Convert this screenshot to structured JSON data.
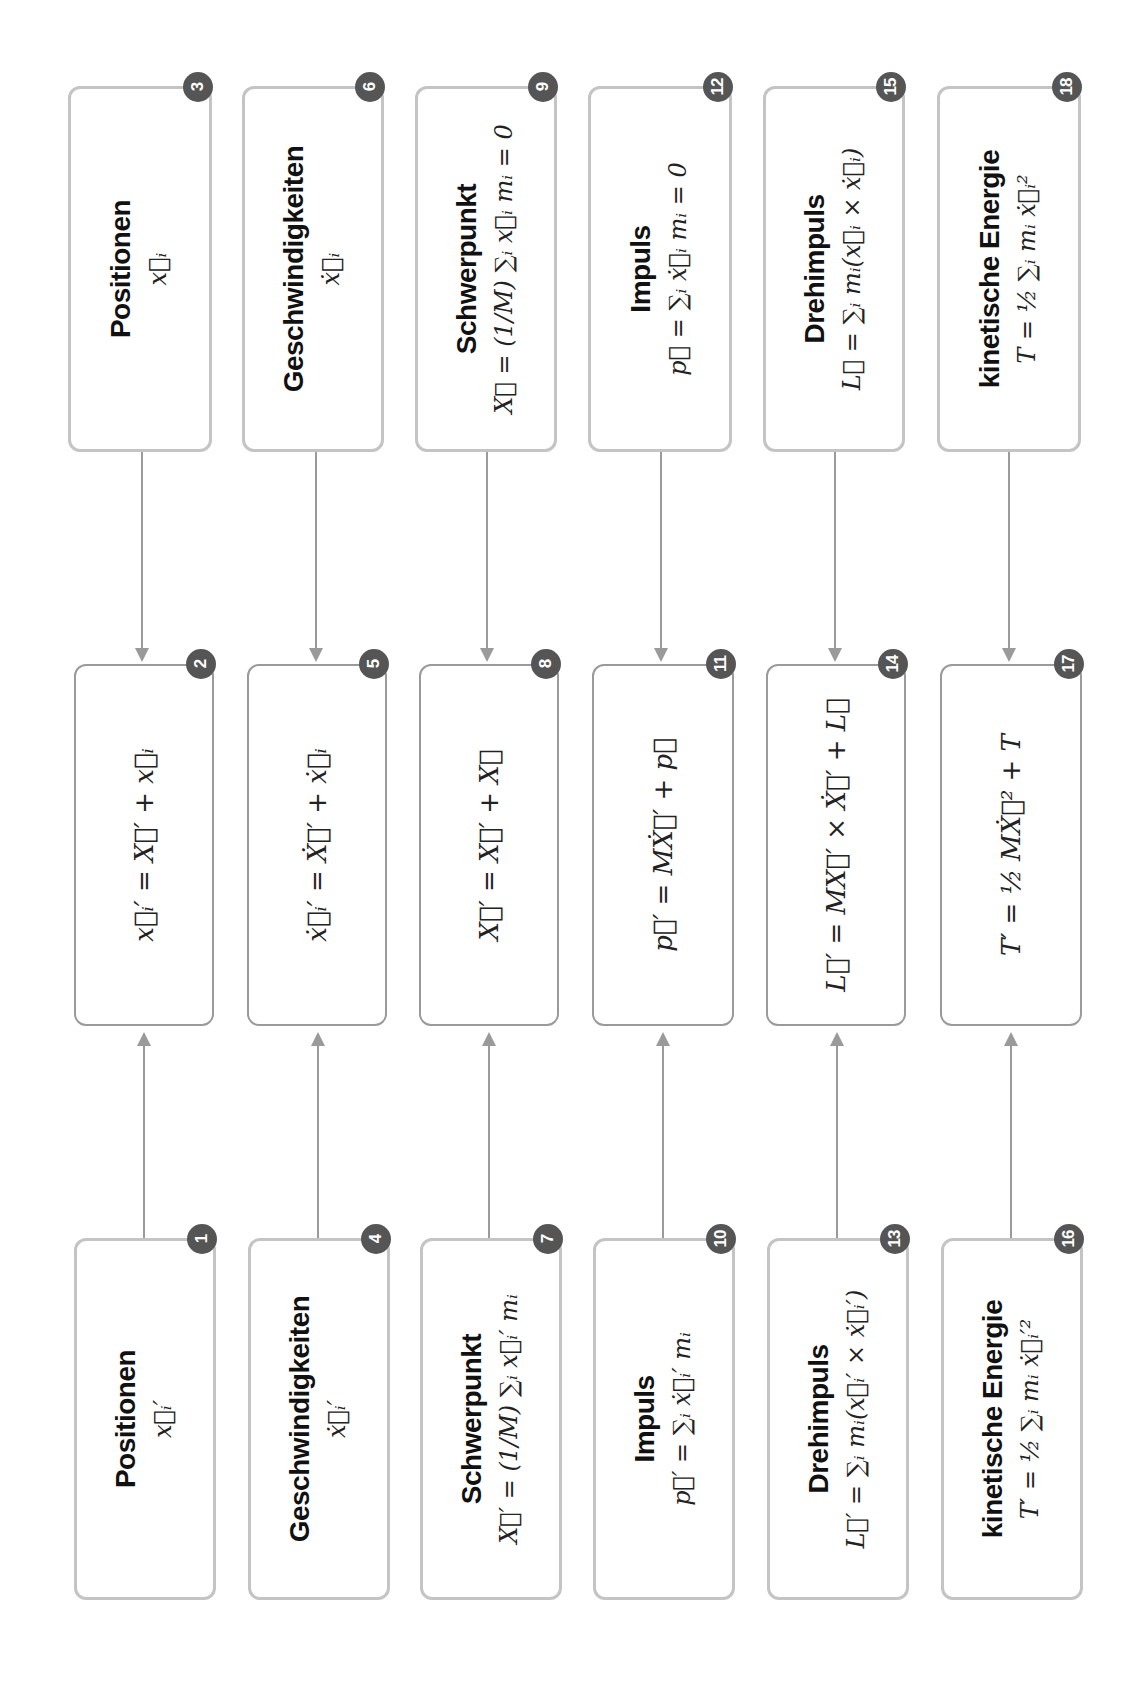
{
  "colors": {
    "badge": "#555555",
    "outer_border": "#c4c4c4",
    "inner_border": "#9a9a9a",
    "arrow": "#9a9a9a"
  },
  "orientation": "content rotated 90° counter-clockwise",
  "columns": [
    {
      "bottom": {
        "badge": "1",
        "title": "Positionen",
        "formula": "x⃗ᵢ′"
      },
      "middle": {
        "badge": "2",
        "formula": "x⃗ᵢ′ = X⃗′ + x⃗ᵢ"
      },
      "top": {
        "badge": "3",
        "title": "Positionen",
        "formula": "x⃗ᵢ"
      }
    },
    {
      "bottom": {
        "badge": "4",
        "title": "Geschwindigkeiten",
        "formula": "ẋ⃗ᵢ′"
      },
      "middle": {
        "badge": "5",
        "formula": "ẋ⃗ᵢ′ = Ẋ⃗′ + ẋ⃗ᵢ"
      },
      "top": {
        "badge": "6",
        "title": "Geschwindigkeiten",
        "formula": "ẋ⃗ᵢ"
      }
    },
    {
      "bottom": {
        "badge": "7",
        "title": "Schwerpunkt",
        "formula": "X⃗′ = (1/M) ∑ᵢ x⃗ᵢ′ mᵢ"
      },
      "middle": {
        "badge": "8",
        "formula": "X⃗′ = X⃗′ + X⃗"
      },
      "top": {
        "badge": "9",
        "title": "Schwerpunkt",
        "formula": "X⃗ = (1/M) ∑ᵢ x⃗ᵢ mᵢ = 0"
      }
    },
    {
      "bottom": {
        "badge": "10",
        "title": "Impuls",
        "formula": "p⃗′ = ∑ᵢ ẋ⃗ᵢ′ mᵢ"
      },
      "middle": {
        "badge": "11",
        "formula": "p⃗′ = MẊ⃗′ + p⃗"
      },
      "top": {
        "badge": "12",
        "title": "Impuls",
        "formula": "p⃗ = ∑ᵢ ẋ⃗ᵢ mᵢ = 0"
      }
    },
    {
      "bottom": {
        "badge": "13",
        "title": "Drehimpuls",
        "formula": "L⃗′ = ∑ᵢ mᵢ(x⃗ᵢ′ × ẋ⃗ᵢ′)"
      },
      "middle": {
        "badge": "14",
        "formula": "L⃗′ = MX⃗′ × Ẋ⃗′ + L⃗"
      },
      "top": {
        "badge": "15",
        "title": "Drehimpuls",
        "formula": "L⃗ = ∑ᵢ mᵢ(x⃗ᵢ × ẋ⃗ᵢ)"
      }
    },
    {
      "bottom": {
        "badge": "16",
        "title": "kinetische Energie",
        "formula": "T′ = ½ ∑ᵢ mᵢ ẋ⃗ᵢ′²"
      },
      "middle": {
        "badge": "17",
        "formula": "T′ = ½ MẊ⃗² + T"
      },
      "top": {
        "badge": "18",
        "title": "kinetische Energie",
        "formula": "T = ½ ∑ᵢ mᵢ ẋ⃗ᵢ²"
      }
    }
  ]
}
